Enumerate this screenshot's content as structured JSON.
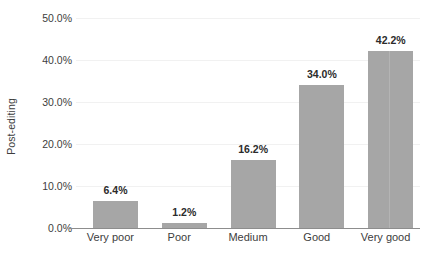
{
  "chart_data": {
    "type": "bar",
    "title": "",
    "subtitle": "",
    "xlabel": "",
    "ylabel": "Post-editing",
    "categories": [
      "Very poor",
      "Poor",
      "Medium",
      "Good",
      "Very good"
    ],
    "values": [
      6.4,
      1.2,
      16.2,
      34.0,
      42.2
    ],
    "value_labels": [
      "6.4%",
      "1.2%",
      "16.2%",
      "34.0%",
      "42.2%"
    ],
    "ylim": [
      0,
      50
    ],
    "ytick_values": [
      0,
      10,
      20,
      30,
      40,
      50
    ],
    "ytick_labels": [
      "0.0%",
      "10.0%",
      "20.0%",
      "30.0%",
      "40.0%",
      "50.0%"
    ],
    "grid": "horizontal",
    "legend": "none",
    "unit": "percent",
    "colors": {
      "bar_fill": "#a6a6a6",
      "gridline": "#f1f1f1",
      "axis_line": "#8d8d8d",
      "tick_label": "#3d3d3d",
      "value_label": "#2b2b2b",
      "background": "#ffffff"
    }
  }
}
